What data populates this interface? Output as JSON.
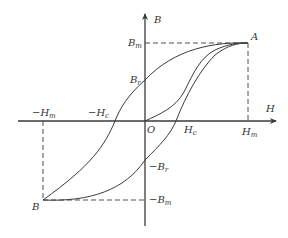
{
  "figure": {
    "axes": {
      "x_label": "H",
      "y_label": "B",
      "origin_label": "O"
    },
    "points": {
      "A": "A",
      "B": "B"
    },
    "tick_labels": {
      "Bm": {
        "main": "B",
        "sub": "m"
      },
      "Br": {
        "main": "B",
        "sub": "r"
      },
      "neg_Br": {
        "main": "−B",
        "sub": "r"
      },
      "neg_Bm": {
        "main": "−B",
        "sub": "m"
      },
      "Hm": {
        "main": "H",
        "sub": "m"
      },
      "Hc": {
        "main": "H",
        "sub": "c"
      },
      "neg_Hm": {
        "main": "−H",
        "sub": "m"
      },
      "neg_Hc": {
        "main": "−H",
        "sub": "c"
      }
    },
    "curves": [
      "initial magnetization curve (O to A)",
      "descending branch (A through Br, −Hc to B)",
      "ascending branch (B through −Br, Hc to A)"
    ],
    "colors": {
      "line": "#3a3a3a",
      "text": "#333333",
      "background": "#ffffff"
    }
  }
}
